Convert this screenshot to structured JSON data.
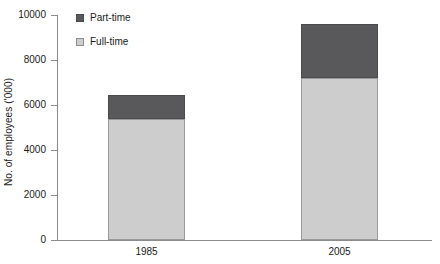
{
  "chart_data": {
    "type": "bar",
    "stacked": true,
    "title": "",
    "xlabel": "",
    "ylabel": "No. of employees ('000)",
    "categories": [
      "1985",
      "2005"
    ],
    "series": [
      {
        "name": "Full-time",
        "values": [
          5400,
          7200
        ],
        "color": "#cdcdcd"
      },
      {
        "name": "Part-time",
        "values": [
          1050,
          2400
        ],
        "color": "#59595b"
      }
    ],
    "totals": [
      6450,
      9600
    ],
    "ylim": [
      0,
      10000
    ],
    "yticks": [
      0,
      2000,
      4000,
      6000,
      8000,
      10000
    ],
    "ytick_labels": [
      "0",
      "2000",
      "4000",
      "6000",
      "8000",
      "10000"
    ],
    "grid": false,
    "legend_position": "top-left-inside",
    "stack_order_bottom_to_top": [
      "Full-time",
      "Part-time"
    ]
  },
  "axis": {
    "y_title": "No. of employees ('000)",
    "tick_0": "0",
    "tick_1": "2000",
    "tick_2": "4000",
    "tick_3": "6000",
    "tick_4": "8000",
    "tick_5": "10000"
  },
  "legend": {
    "part_time_label": "Part-time",
    "full_time_label": "Full-time"
  },
  "categories": {
    "c0": "1985",
    "c1": "2005"
  },
  "colors": {
    "part_time": "#59595b",
    "full_time": "#cdcdcd",
    "axis": "#8c8c8c",
    "background": "#ffffff"
  }
}
